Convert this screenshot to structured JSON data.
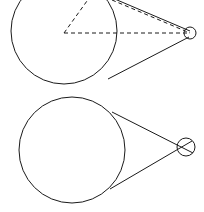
{
  "figure": {
    "background_color": "#ffffff",
    "stroke_color": "#1a1a1a",
    "stroke_width": 1,
    "dash_pattern": "4 3",
    "canvas": {
      "width": 204,
      "height": 212
    }
  },
  "chart_data": {
    "type": "diagram",
    "xlabel": "",
    "ylabel": "",
    "xlim": [
      0,
      204
    ],
    "ylim": [
      0,
      212
    ],
    "grid": false,
    "legend": "none",
    "panels": [
      {
        "name": "upper-figure",
        "label": "Upper figure with dashed construction triangle",
        "shapes": [
          {
            "name": "upper-large-circle",
            "kind": "circle",
            "cx": 64,
            "cy": 31,
            "r": 53,
            "style": "solid",
            "clipped_at_top": true
          },
          {
            "name": "upper-small-circle",
            "kind": "circle",
            "cx": 190,
            "cy": 33,
            "r": 6,
            "style": "solid"
          },
          {
            "name": "upper-tangent-line-top",
            "kind": "line",
            "x1": 103,
            "y1": -6,
            "x2": 190,
            "y2": 31,
            "style": "solid"
          },
          {
            "name": "upper-tangent-line-bottom",
            "kind": "line",
            "x1": 108,
            "y1": 79,
            "x2": 189,
            "y2": 37,
            "style": "solid"
          },
          {
            "name": "upper-dashed-radius-horizontal",
            "kind": "line",
            "x1": 64,
            "y1": 33,
            "x2": 190,
            "y2": 33,
            "style": "dashed"
          },
          {
            "name": "upper-dashed-radius-diagonal",
            "kind": "line",
            "x1": 64,
            "y1": 33,
            "x2": 92,
            "y2": -6,
            "style": "dashed"
          },
          {
            "name": "upper-dashed-hypotenuse",
            "kind": "line",
            "x1": 112,
            "y1": 0,
            "x2": 190,
            "y2": 33,
            "style": "dashed"
          }
        ]
      },
      {
        "name": "lower-figure",
        "label": "Lower figure with solid tangent lines only",
        "shapes": [
          {
            "name": "lower-large-circle",
            "kind": "circle",
            "cx": 72,
            "cy": 150,
            "r": 53,
            "style": "solid"
          },
          {
            "name": "lower-small-circle",
            "kind": "circle",
            "cx": 186,
            "cy": 147,
            "r": 9,
            "style": "solid"
          },
          {
            "name": "lower-tangent-line-top",
            "kind": "line",
            "x1": 112,
            "y1": 112,
            "x2": 193,
            "y2": 153,
            "style": "solid"
          },
          {
            "name": "lower-tangent-line-bottom",
            "kind": "line",
            "x1": 110,
            "y1": 189,
            "x2": 192,
            "y2": 141,
            "style": "solid"
          }
        ]
      }
    ]
  }
}
